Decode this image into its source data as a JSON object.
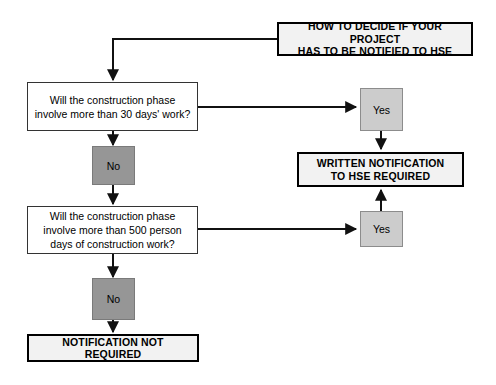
{
  "diagram": {
    "title_box": {
      "label": "HOW TO DECIDE IF YOUR PROJECT\nHAS TO BE NOTIFIED TO HSE"
    },
    "question_1": {
      "label": "Will the construction phase\ninvolve more than 30 days' work?"
    },
    "question_2": {
      "label": "Will the construction phase\ninvolve more than 500 person\ndays of construction work?"
    },
    "yes_1": {
      "label": "Yes"
    },
    "yes_2": {
      "label": "Yes"
    },
    "no_1": {
      "label": "No"
    },
    "no_2": {
      "label": "No"
    },
    "outcome_notify": {
      "label": "WRITTEN NOTIFICATION\nTO HSE REQUIRED"
    },
    "outcome_not_required": {
      "label": "NOTIFICATION NOT REQUIRED"
    },
    "colors": {
      "background": "#ffffff",
      "line": "#111111",
      "terminal_fill": "#f2f2f2",
      "terminal_border": "#000000",
      "question_fill": "#ffffff",
      "question_border": "#333333",
      "yes_fill": "#cccccc",
      "yes_border": "#8c8c8c",
      "no_fill": "#969696",
      "no_border": "#7a7a7a",
      "text": "#000000"
    }
  }
}
